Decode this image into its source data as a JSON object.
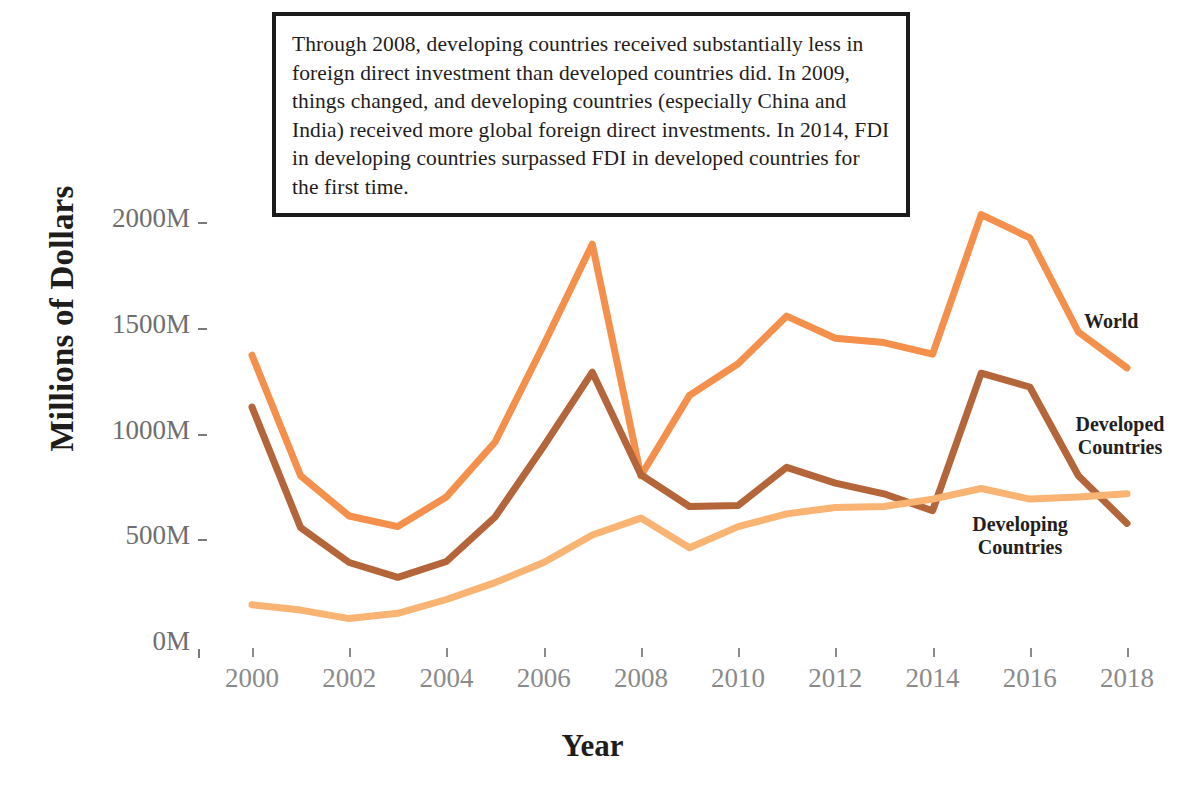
{
  "annotation": {
    "text": "Through 2008, developing countries received substantially less in foreign direct investment than developed countries did. In 2009, things changed, and developing countries (especially China and India) received more global foreign direct investments. In 2014, FDI in developing countries surpassed FDI in developed countries for the first time."
  },
  "labels": {
    "world": "World",
    "developed": "Developed\nCountries",
    "developing": "Developing\nCountries"
  },
  "colors": {
    "world": "#F4904B",
    "developed": "#B4653A",
    "developing": "#F9B372",
    "annotation_border": "#1b1b1b",
    "tick_text": "#7d7d7d",
    "axis_title": "#1f1d1c",
    "background": "#ffffff"
  },
  "chart_data": {
    "type": "line",
    "title": "",
    "xlabel": "Year",
    "ylabel": "Millions of Dollars",
    "xlim": [
      2000,
      2018
    ],
    "ylim": [
      0,
      2100
    ],
    "grid": false,
    "legend": "direct-labels-right",
    "xticks": [
      2000,
      2002,
      2004,
      2006,
      2008,
      2010,
      2012,
      2014,
      2016,
      2018
    ],
    "xtick_labels": [
      "2000",
      "2002",
      "2004",
      "2006",
      "2008",
      "2010",
      "2012",
      "2014",
      "2016",
      "2018"
    ],
    "yticks": [
      0,
      500,
      1000,
      1500,
      2000
    ],
    "ytick_labels": [
      "0M",
      "500M",
      "1000M",
      "1500M",
      "2000M"
    ],
    "x": [
      2000,
      2001,
      2002,
      2003,
      2004,
      2005,
      2006,
      2007,
      2008,
      2009,
      2010,
      2011,
      2012,
      2013,
      2014,
      2015,
      2016,
      2017,
      2018
    ],
    "series": [
      {
        "name": "World",
        "color": "#F4904B",
        "values": [
          1370,
          800,
          610,
          560,
          700,
          960,
          1420,
          1895,
          800,
          1180,
          1330,
          1555,
          1450,
          1430,
          1375,
          2035,
          1925,
          1480,
          1310
        ]
      },
      {
        "name": "Developed Countries",
        "color": "#B4653A",
        "values": [
          1125,
          555,
          390,
          320,
          395,
          605,
          940,
          1290,
          805,
          655,
          660,
          840,
          765,
          715,
          635,
          1285,
          1220,
          800,
          575
        ]
      },
      {
        "name": "Developing Countries",
        "color": "#F9B372",
        "values": [
          190,
          165,
          125,
          150,
          215,
          295,
          390,
          520,
          600,
          460,
          560,
          620,
          650,
          655,
          690,
          740,
          690,
          700,
          715
        ]
      }
    ],
    "annotations": [
      {
        "text": "Through 2008, developing countries received substantially less in foreign direct investment than developed countries did. In 2009, things changed, and developing countries (especially China and India) received more global foreign direct investments. In 2014, FDI in developing countries surpassed FDI in developed countries for the first time.",
        "position": "top-center"
      }
    ]
  }
}
